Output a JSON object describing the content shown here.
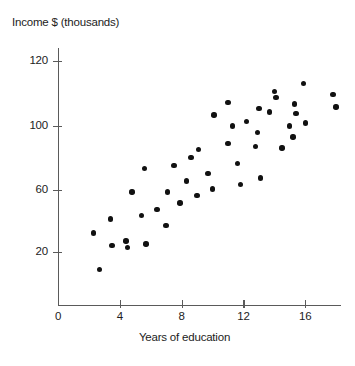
{
  "chart_data": {
    "type": "scatter",
    "title": "",
    "ylabel": "Income $ (thousands)",
    "xlabel": "Years of education",
    "grid": false,
    "legend": null,
    "xlim": [
      0,
      19
    ],
    "ylim": [
      0,
      132
    ],
    "x_ticks": [
      {
        "label": "0",
        "value": 0
      },
      {
        "label": "4",
        "value": 4
      },
      {
        "label": "8",
        "value": 8
      },
      {
        "label": "12",
        "value": 12
      },
      {
        "label": "16",
        "value": 16
      }
    ],
    "y_ticks": [
      {
        "label": "120",
        "value": 120
      },
      {
        "label": "100",
        "value": 100
      },
      {
        "label": "60",
        "value": 60
      },
      {
        "label": "20",
        "value": 20
      }
    ],
    "marker": {
      "shape": "circle",
      "color": "#111111",
      "size": 5.4
    },
    "points": [
      {
        "x": 2.3,
        "y": 32
      },
      {
        "x": 2.7,
        "y": 9
      },
      {
        "x": 3.4,
        "y": 41
      },
      {
        "x": 3.5,
        "y": 24
      },
      {
        "x": 4.4,
        "y": 27
      },
      {
        "x": 4.5,
        "y": 23
      },
      {
        "x": 4.8,
        "y": 58
      },
      {
        "x": 5.4,
        "y": 43
      },
      {
        "x": 5.6,
        "y": 73
      },
      {
        "x": 5.7,
        "y": 25
      },
      {
        "x": 6.4,
        "y": 47
      },
      {
        "x": 7.0,
        "y": 37
      },
      {
        "x": 7.1,
        "y": 58
      },
      {
        "x": 7.5,
        "y": 75
      },
      {
        "x": 7.9,
        "y": 51
      },
      {
        "x": 8.3,
        "y": 65
      },
      {
        "x": 8.6,
        "y": 80
      },
      {
        "x": 9.0,
        "y": 56
      },
      {
        "x": 9.1,
        "y": 85
      },
      {
        "x": 9.7,
        "y": 70
      },
      {
        "x": 10.0,
        "y": 60
      },
      {
        "x": 10.1,
        "y": 107
      },
      {
        "x": 11.0,
        "y": 115
      },
      {
        "x": 11.0,
        "y": 89
      },
      {
        "x": 11.3,
        "y": 100
      },
      {
        "x": 11.6,
        "y": 76
      },
      {
        "x": 11.8,
        "y": 63
      },
      {
        "x": 12.2,
        "y": 103
      },
      {
        "x": 12.8,
        "y": 87
      },
      {
        "x": 12.9,
        "y": 96
      },
      {
        "x": 13.0,
        "y": 111
      },
      {
        "x": 13.1,
        "y": 67
      },
      {
        "x": 13.7,
        "y": 109
      },
      {
        "x": 14.0,
        "y": 122
      },
      {
        "x": 14.1,
        "y": 118
      },
      {
        "x": 14.5,
        "y": 86
      },
      {
        "x": 15.0,
        "y": 100
      },
      {
        "x": 15.2,
        "y": 93
      },
      {
        "x": 15.3,
        "y": 114
      },
      {
        "x": 15.4,
        "y": 108
      },
      {
        "x": 15.9,
        "y": 127
      },
      {
        "x": 16.0,
        "y": 102
      },
      {
        "x": 17.8,
        "y": 120
      },
      {
        "x": 18.0,
        "y": 112
      }
    ]
  }
}
